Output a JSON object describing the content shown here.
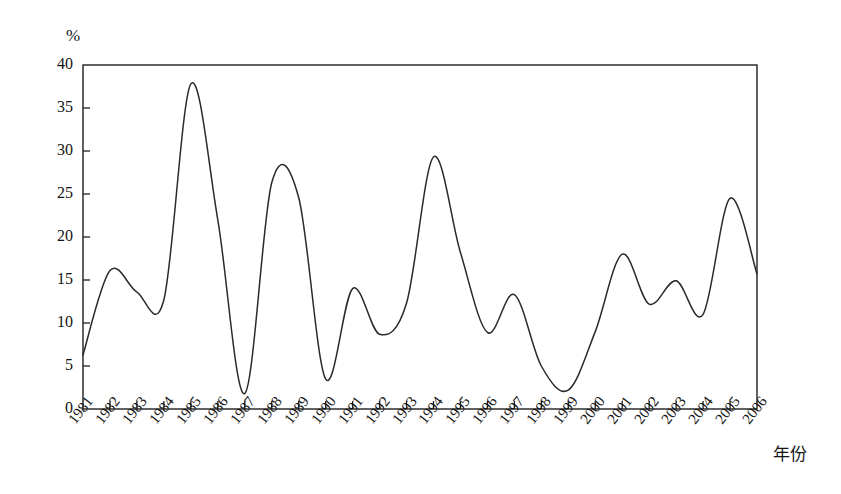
{
  "chart_data": {
    "type": "line",
    "title": "",
    "subtitle": "",
    "xlabel": "年份",
    "ylabel": "%",
    "unit_symbol": "%",
    "xlim": [
      1981,
      2006
    ],
    "ylim": [
      0,
      40
    ],
    "grid": false,
    "legend": "none",
    "smoothing": "spline",
    "line_color": "#2a2a2a",
    "background_color": "#ffffff",
    "axis_color": "#1f1f1f",
    "y_ticks": [
      0,
      5,
      10,
      15,
      20,
      25,
      30,
      35,
      40
    ],
    "x_ticks": [
      "1981",
      "1982",
      "1983",
      "1984",
      "1985",
      "1986",
      "1987",
      "1988",
      "1989",
      "1990",
      "1991",
      "1992",
      "1993",
      "1994",
      "1995",
      "1996",
      "1997",
      "1998",
      "1999",
      "2000",
      "2001",
      "2002",
      "2003",
      "2004",
      "2005",
      "2006"
    ],
    "x": [
      1981,
      1982,
      1983,
      1984,
      1985,
      1986,
      1987,
      1988,
      1989,
      1990,
      1991,
      1992,
      1993,
      1994,
      1995,
      1996,
      1997,
      1998,
      1999,
      2000,
      2001,
      2002,
      2003,
      2004,
      2005,
      2006
    ],
    "series": [
      {
        "name": "增长率",
        "values": [
          6.3,
          16.1,
          13.6,
          12.7,
          37.8,
          22.0,
          1.8,
          26.3,
          24.6,
          3.5,
          14.0,
          8.7,
          12.3,
          29.3,
          18.2,
          8.9,
          13.3,
          5.0,
          2.2,
          9.0,
          18.0,
          12.2,
          14.9,
          11.0,
          24.5,
          15.7
        ]
      }
    ],
    "annotations": []
  },
  "axis": {
    "y_unit": "%",
    "x_title": "年份"
  }
}
